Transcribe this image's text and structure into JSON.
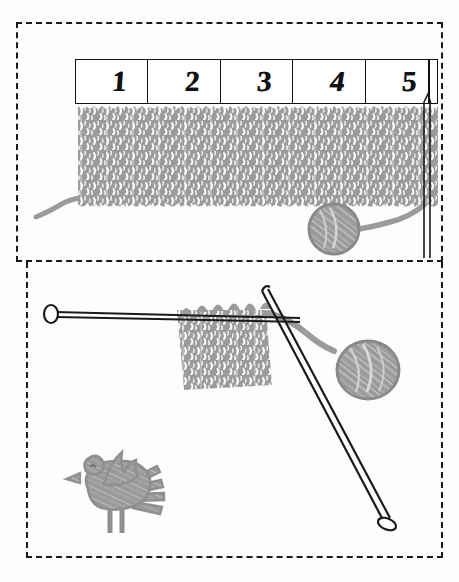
{
  "figure": {
    "background_color": "#fdfdfc",
    "ink_color": "#1a1a1a",
    "yarn_color": "#9b9b9b",
    "panels": [
      {
        "name": "top-panel",
        "caption": "Knitted fabric with numbered measuring ruler above it"
      },
      {
        "name": "bottom-panel",
        "caption": "Work in progress on two needles, with yarn ball and bird"
      }
    ]
  },
  "ruler": {
    "name": "measuring-ruler",
    "marks": [
      "1",
      "2",
      "3",
      "4",
      "5"
    ],
    "unit_count": 5
  },
  "top_panel": {
    "fabric_label": "knitted-swatch",
    "yarn_ball_label": "yarn-ball",
    "yarn_tail_label": "yarn-tail",
    "needle_label": "vertical-needle"
  },
  "bottom_panel": {
    "fabric_label": "knitting-in-progress",
    "left_needle_label": "horizontal-needle",
    "right_needle_label": "diagonal-needle",
    "yarn_ball_label": "yarn-ball",
    "bird_label": "bird-drawing"
  },
  "colors": {
    "ink": "#1a1a1a",
    "yarn_gray": "#9b9b9b",
    "yarn_gray_dark": "#8a8a8a",
    "paper": "#fdfdfc"
  }
}
